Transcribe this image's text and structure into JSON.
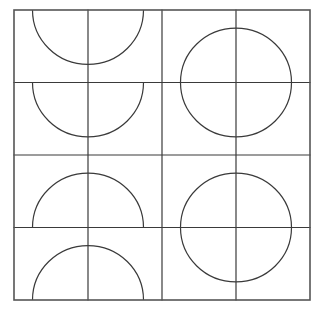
{
  "figure": {
    "type": "geometric-tiling",
    "background_color": "#ffffff",
    "stroke_color": "#3a3a3a",
    "border_color": "#555555",
    "stroke_width": 1.2,
    "border_width": 1.6,
    "grid": {
      "rows": 4,
      "cols": 4,
      "origin_x": 14,
      "origin_y": 10,
      "cell_width": 74,
      "cell_height": 72.5
    },
    "arc": {
      "radius_ratio": 0.75,
      "description": "quarter circle centered on one tile corner"
    },
    "tiles": [
      {
        "row": 0,
        "col": 0,
        "corner": "top-right"
      },
      {
        "row": 0,
        "col": 1,
        "corner": "top-left"
      },
      {
        "row": 0,
        "col": 2,
        "corner": "bottom-right"
      },
      {
        "row": 0,
        "col": 3,
        "corner": "bottom-left"
      },
      {
        "row": 1,
        "col": 0,
        "corner": "top-right"
      },
      {
        "row": 1,
        "col": 1,
        "corner": "top-left"
      },
      {
        "row": 1,
        "col": 2,
        "corner": "top-right"
      },
      {
        "row": 1,
        "col": 3,
        "corner": "top-left"
      },
      {
        "row": 2,
        "col": 0,
        "corner": "bottom-right"
      },
      {
        "row": 2,
        "col": 1,
        "corner": "bottom-left"
      },
      {
        "row": 2,
        "col": 2,
        "corner": "bottom-right"
      },
      {
        "row": 2,
        "col": 3,
        "corner": "bottom-left"
      },
      {
        "row": 3,
        "col": 0,
        "corner": "bottom-right"
      },
      {
        "row": 3,
        "col": 1,
        "corner": "bottom-left"
      },
      {
        "row": 3,
        "col": 2,
        "corner": "top-right"
      },
      {
        "row": 3,
        "col": 3,
        "corner": "top-left"
      }
    ]
  }
}
